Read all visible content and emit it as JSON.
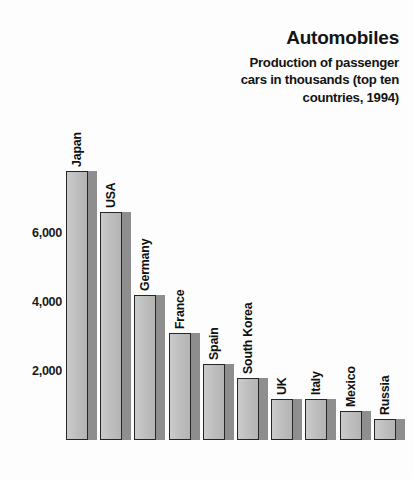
{
  "title": "Automobiles",
  "subtitle": "Production of passenger cars in thousands (top ten countries, 1994)",
  "subtitle_lines": [
    "Production of passenger",
    "cars in thousands (top ten",
    "countries, 1994)"
  ],
  "axis": {
    "y_ticks": [
      "2,000",
      "4,000",
      "6,000"
    ]
  },
  "countries": [
    "Japan",
    "USA",
    "Germany",
    "France",
    "Spain",
    "South Korea",
    "UK",
    "Italy",
    "Mexico",
    "Russia"
  ],
  "colors": {
    "background": "#fdfdfd",
    "bar_face": "#c0c0c0",
    "bar_outline": "#262626",
    "bar_shadow": "#8e8e8e",
    "text": "#101010"
  },
  "chart_data": {
    "type": "bar",
    "title": "Automobiles",
    "subtitle": "Production of passenger cars in thousands (top ten countries, 1994)",
    "xlabel": "",
    "ylabel": "",
    "unit": "thousands of cars",
    "year": 1994,
    "grid": false,
    "legend": "none",
    "orientation": "vertical",
    "ylim": [
      0,
      8400
    ],
    "ytick_values": [
      2000,
      4000,
      6000
    ],
    "ytick_labels": [
      "2,000",
      "4,000",
      "6,000"
    ],
    "categories": [
      "Japan",
      "USA",
      "Germany",
      "France",
      "Spain",
      "South Korea",
      "UK",
      "Italy",
      "Mexico",
      "Russia"
    ],
    "values": [
      7800,
      6600,
      4200,
      3100,
      2200,
      1800,
      1200,
      1200,
      850,
      600
    ]
  }
}
